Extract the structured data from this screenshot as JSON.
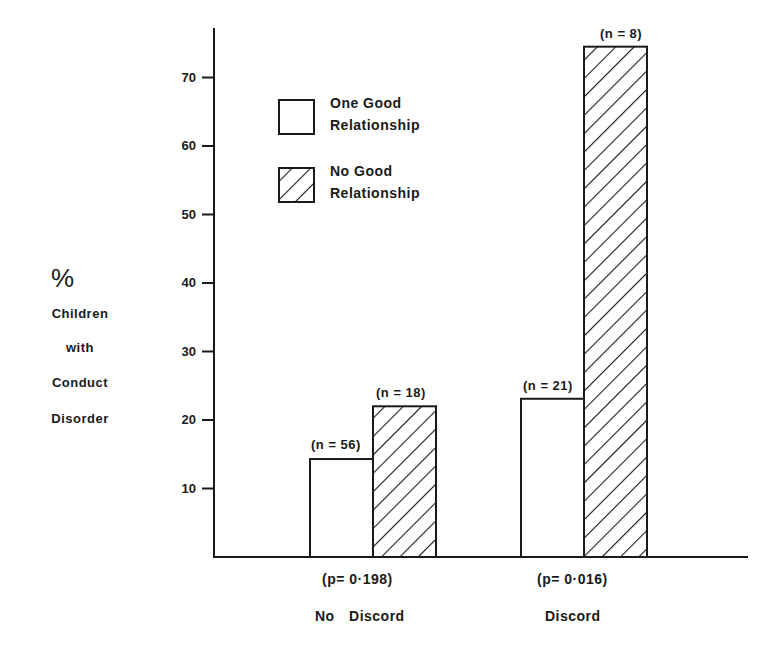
{
  "chart_data": {
    "type": "bar",
    "title": "",
    "xlabel": "",
    "ylabel": "% Children with Conduct Disorder",
    "ylabel_lines": [
      "%",
      "Children",
      "with",
      "Conduct",
      "Disorder"
    ],
    "ylim": [
      0,
      78
    ],
    "yticks": [
      10,
      20,
      30,
      40,
      50,
      60,
      70
    ],
    "grid": false,
    "legend_position": "upper-left inside plot",
    "categories": [
      "No Discord",
      "Discord"
    ],
    "category_pvalues": [
      "(p= 0·198)",
      "(p= 0·016)"
    ],
    "series": [
      {
        "name": "One Good Relationship",
        "fill": "white",
        "values": [
          14.3,
          23.1
        ],
        "n_labels": [
          "(n = 56)",
          "(n = 21)"
        ]
      },
      {
        "name": "No Good Relationship",
        "fill": "hatched",
        "values": [
          22.0,
          74.5
        ],
        "n_labels": [
          "(n = 18)",
          "(n = 8)"
        ]
      }
    ]
  },
  "legend": {
    "items": [
      {
        "line1": "One Good",
        "line2": "Relationship",
        "fill": "white"
      },
      {
        "line1": "No Good",
        "line2": "Relationship",
        "fill": "hatched"
      }
    ]
  },
  "colors": {
    "ink": "#1a1a1a",
    "background": "#ffffff"
  }
}
